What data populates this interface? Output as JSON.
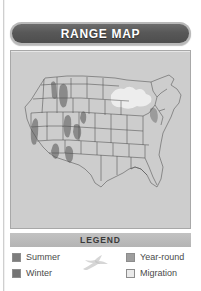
{
  "panel": {
    "title": "RANGE MAP",
    "title_icon": "none"
  },
  "map": {
    "name": "united-states-range-map",
    "region": "Continental United States",
    "background_color": "#cdcdcd",
    "state_fill": "#ffffff",
    "state_border_color": "#555555",
    "range_shading": {
      "summer_color": "#7d7d7d",
      "winter_color": "#747474",
      "year_round_color": "#9e9e9e",
      "migration_color": "#eaeaea"
    },
    "shaded_areas": [
      {
        "label": "Sierra Nevada, California",
        "category": "summer"
      },
      {
        "label": "Cascades, Washington",
        "category": "summer"
      },
      {
        "label": "Idaho / Montana border ranges",
        "category": "summer"
      },
      {
        "label": "Central Utah highlands",
        "category": "summer"
      },
      {
        "label": "Southern Nevada / Arizona",
        "category": "summer"
      },
      {
        "label": "Great Lakes region",
        "category": "migration"
      }
    ]
  },
  "legend": {
    "header": "LEGEND",
    "bird_icon": "flying-bird-icon",
    "items": [
      {
        "label": "Summer",
        "swatch_class": "sw-summer",
        "icon": "summer-swatch-icon"
      },
      {
        "label": "Winter",
        "swatch_class": "sw-winter",
        "icon": "winter-swatch-icon"
      },
      {
        "label": "Year-round",
        "swatch_class": "sw-yearround",
        "icon": "year-round-swatch-icon"
      },
      {
        "label": "Migration",
        "swatch_class": "sw-migration",
        "icon": "migration-swatch-icon"
      }
    ]
  }
}
